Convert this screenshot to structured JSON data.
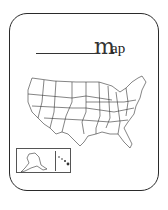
{
  "title": {
    "blank": "________",
    "first_letter": "m",
    "rest": "ap"
  },
  "map": {
    "subject": "United States outline map",
    "inset": [
      "Alaska",
      "Hawaii"
    ]
  },
  "colors": {
    "stroke": "#2a2a2a",
    "background": "#ffffff"
  }
}
